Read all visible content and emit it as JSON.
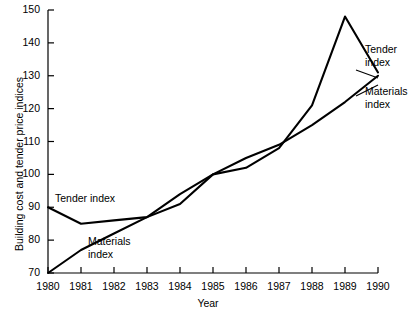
{
  "chart_data": {
    "type": "line",
    "title": "",
    "xlabel": "Year",
    "ylabel": "Building cost and tender price indices",
    "x": [
      1980,
      1981,
      1982,
      1983,
      1984,
      1985,
      1986,
      1987,
      1988,
      1989,
      1990
    ],
    "xtick_labels": [
      "1980",
      "1981",
      "1982",
      "1983",
      "1984",
      "1985",
      "1986",
      "1987",
      "1988",
      "1989",
      "1990"
    ],
    "ytick_labels": [
      "70",
      "80",
      "90",
      "100",
      "110",
      "120",
      "130",
      "140",
      "150"
    ],
    "yticks": [
      70,
      80,
      90,
      100,
      110,
      120,
      130,
      140,
      150
    ],
    "xlim": [
      1980,
      1990
    ],
    "ylim": [
      70,
      150
    ],
    "grid": false,
    "legend_position": "inline-annotations",
    "series": [
      {
        "name": "Tender index",
        "values": [
          90,
          85,
          86,
          87,
          94,
          100,
          102,
          108,
          121,
          148,
          131
        ],
        "color": "#000000"
      },
      {
        "name": "Materials index",
        "values": [
          70,
          77,
          82,
          87,
          91,
          100,
          105,
          109,
          115,
          122,
          130
        ],
        "color": "#000000"
      }
    ],
    "annotations": [
      {
        "text": "Tender index",
        "series": "Tender index",
        "placement": "upper-left"
      },
      {
        "text": "Materials\nindex",
        "series": "Materials index",
        "placement": "lower-left"
      },
      {
        "text": "Tender\nindex",
        "series": "Tender index",
        "placement": "right"
      },
      {
        "text": "Materials\nindex",
        "series": "Materials index",
        "placement": "right"
      }
    ]
  },
  "axes": {
    "y_label": "Building cost and tender price indices",
    "x_label": "Year"
  },
  "annotations": {
    "tender_left": "Tender index",
    "materials_left": "Materials\nindex",
    "tender_right": "Tender\nindex",
    "materials_right": "Materials\nindex"
  }
}
